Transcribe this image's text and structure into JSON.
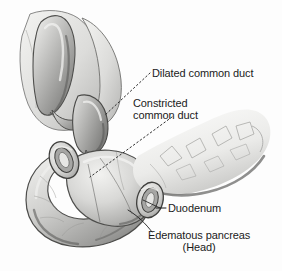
{
  "figure": {
    "type": "medical-illustration",
    "style": "grayscale pen-and-wash anatomical drawing",
    "background_color": "#fdfdfd",
    "ink_color": "#1b1b1b"
  },
  "labels": {
    "dilated_duct": "Dilated common duct",
    "constricted_duct_line1": "Constricted",
    "constricted_duct_line2": "common duct",
    "duodenum": "Duodenum",
    "pancreas_line1": "Edematous pancreas",
    "pancreas_line2": "(Head)"
  },
  "structures": [
    {
      "name": "liver",
      "description": "pale wedge-shaped lobe, upper left background"
    },
    {
      "name": "gallbladder",
      "description": "elongated pear-shaped sac, upper left foreground"
    },
    {
      "name": "cystic-duct",
      "description": "short tube joining gallbladder to common duct"
    },
    {
      "name": "dilated-common-duct",
      "description": "bulging swollen duct above the pancreas head"
    },
    {
      "name": "constricted-common-duct",
      "description": "narrowed duct segment entering pancreas head"
    },
    {
      "name": "duodenum",
      "description": "C-shaped loop wrapping the pancreatic head, two cut stumps"
    },
    {
      "name": "duodenum-stump-upper",
      "description": "elliptical cut ring, upper left of head"
    },
    {
      "name": "duodenum-stump-lower",
      "description": "elliptical cut ring, lower right of head"
    },
    {
      "name": "pancreas-head",
      "description": "swollen rounded mass enclosed by duodenal loop"
    },
    {
      "name": "pancreas-body-tail",
      "description": "lobulated tapering limb extending to the right"
    }
  ],
  "leaders": [
    {
      "name": "leader-dilated-duct",
      "style": "dotted",
      "from": "label",
      "to": "dilated-common-duct"
    },
    {
      "name": "leader-constricted-duct",
      "style": "dotted",
      "from": "label",
      "to": "pancreas-head-duct"
    },
    {
      "name": "leader-duodenum",
      "style": "solid-dash",
      "from": "label",
      "to": "duodenum-stump-lower"
    },
    {
      "name": "leader-pancreas",
      "style": "solid-curve",
      "from": "label",
      "to": "pancreas-head"
    }
  ],
  "palette": {
    "paper": "#fdfdfd",
    "ink": "#1b1b1b",
    "outline": "#4a4a4a",
    "tissue_light": "#e8e8e6",
    "tissue_mid": "#bdbdbb",
    "tissue_dark": "#8a8a88",
    "shadow": "#6a6a68",
    "tail_pale": "#f1f1ef"
  }
}
